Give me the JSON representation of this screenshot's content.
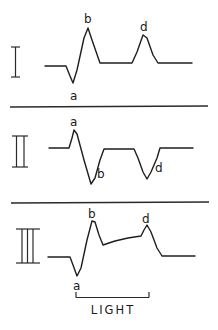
{
  "figure": {
    "panels": [
      {
        "id": "I",
        "roman_label": "I",
        "labels": {
          "a": "a",
          "b": "b",
          "d": "d"
        },
        "trace_points": [
          [
            45,
            66
          ],
          [
            66,
            66
          ],
          [
            70,
            76
          ],
          [
            73,
            83
          ],
          [
            77,
            70
          ],
          [
            84,
            38
          ],
          [
            88,
            28
          ],
          [
            92,
            40
          ],
          [
            100,
            63
          ],
          [
            132,
            63
          ],
          [
            137,
            52
          ],
          [
            143,
            35
          ],
          [
            147,
            38
          ],
          [
            153,
            55
          ],
          [
            158,
            63
          ],
          [
            192,
            63
          ]
        ]
      },
      {
        "id": "II",
        "roman_label": "II",
        "labels": {
          "a": "a",
          "b": "b",
          "d": "d"
        },
        "trace_points": [
          [
            49,
            148
          ],
          [
            69,
            148
          ],
          [
            72,
            138
          ],
          [
            74,
            130
          ],
          [
            77,
            134
          ],
          [
            84,
            160
          ],
          [
            91,
            184
          ],
          [
            95,
            178
          ],
          [
            100,
            160
          ],
          [
            104,
            149
          ],
          [
            134,
            149
          ],
          [
            138,
            158
          ],
          [
            143,
            172
          ],
          [
            147,
            179
          ],
          [
            151,
            172
          ],
          [
            157,
            158
          ],
          [
            160,
            148
          ],
          [
            193,
            148
          ]
        ]
      },
      {
        "id": "III",
        "roman_label": "III",
        "labels": {
          "a": "a",
          "b": "b",
          "d": "d"
        },
        "trace_points": [
          [
            48,
            257
          ],
          [
            70,
            257
          ],
          [
            73,
            265
          ],
          [
            77,
            276
          ],
          [
            81,
            268
          ],
          [
            87,
            240
          ],
          [
            92,
            221
          ],
          [
            95,
            222
          ],
          [
            99,
            235
          ],
          [
            103,
            245
          ],
          [
            115,
            241
          ],
          [
            128,
            238
          ],
          [
            141,
            236
          ],
          [
            144,
            230
          ],
          [
            147,
            225
          ],
          [
            151,
            232
          ],
          [
            157,
            248
          ],
          [
            162,
            256
          ],
          [
            195,
            256
          ]
        ]
      }
    ],
    "stimulus": {
      "label": "LIGHT",
      "onset_x": 76,
      "offset_x": 149
    }
  }
}
